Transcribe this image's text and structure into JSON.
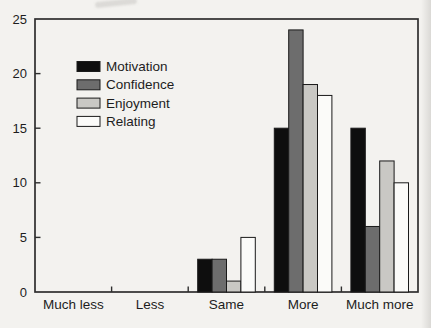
{
  "chart_data": {
    "type": "bar",
    "title": "",
    "xlabel": "",
    "ylabel": "",
    "categories": [
      "Much less",
      "Less",
      "Same",
      "More",
      "Much more"
    ],
    "series": [
      {
        "name": "Motivation",
        "color": "#0e0e0e",
        "values": [
          0,
          0,
          3,
          15,
          15
        ]
      },
      {
        "name": "Confidence",
        "color": "#6d6d6d",
        "values": [
          0,
          0,
          3,
          24,
          6
        ]
      },
      {
        "name": "Enjoyment",
        "color": "#c9c8c4",
        "values": [
          0,
          0,
          1,
          19,
          12
        ]
      },
      {
        "name": "Relating",
        "color": "#fbfbf9",
        "values": [
          0,
          0,
          5,
          18,
          10
        ]
      }
    ],
    "ylim": [
      0,
      25
    ],
    "yticks": [
      0,
      5,
      10,
      15,
      20,
      25
    ],
    "grid": false,
    "frame": true,
    "legend_position": "upper-left-inside",
    "bar_outline_color": "#1a1a1a",
    "axis_color": "#2e2e2e",
    "text_color": "#1d1d1d",
    "background_color": "#f3f2ef"
  }
}
